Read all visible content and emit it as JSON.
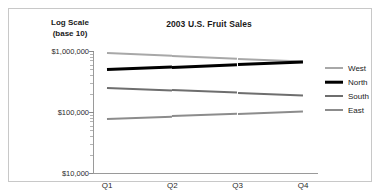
{
  "chart_data": {
    "type": "line",
    "title": "2003 U.S. Fruit Sales",
    "ylabel_line1": "Log Scale",
    "ylabel_line2": "(base 10)",
    "xlabel": "",
    "categories": [
      "Q1",
      "Q2",
      "Q3",
      "Q4"
    ],
    "yscale": "log",
    "ylim": [
      10000,
      1000000
    ],
    "ytick_labels": [
      "$1,000,000",
      "$100,000",
      "$10,000"
    ],
    "ytick_values": [
      1000000,
      100000,
      10000
    ],
    "grid": false,
    "legend_position": "right",
    "series": [
      {
        "name": "West",
        "color": "#a8a8a8",
        "width": 2.0,
        "values": [
          920000,
          830000,
          750000,
          680000
        ]
      },
      {
        "name": "North",
        "color": "#000000",
        "width": 2.6,
        "values": [
          500000,
          550000,
          610000,
          670000
        ]
      },
      {
        "name": "South",
        "color": "#6e6e6e",
        "width": 2.0,
        "values": [
          250000,
          228000,
          208000,
          190000
        ]
      },
      {
        "name": "East",
        "color": "#8c8c8c",
        "width": 2.0,
        "values": [
          78000,
          85000,
          93000,
          102000
        ]
      }
    ]
  }
}
